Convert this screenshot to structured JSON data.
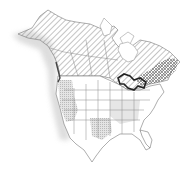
{
  "map": {
    "region": "North America",
    "type": "species range map",
    "colors": {
      "background": "#ffffff",
      "land": "#ffffff",
      "border": "#777777",
      "hatch": "#888888",
      "crosshatch": "#555555",
      "shade": "#dddddd",
      "great_lakes": "#222222"
    },
    "legend": []
  }
}
